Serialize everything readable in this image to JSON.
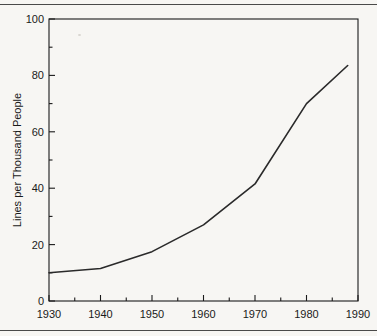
{
  "page": {
    "background_color": "#f7f6f3",
    "rule_color": "#4a4a4a"
  },
  "chart_data": {
    "type": "line",
    "title": "",
    "subtitle": "",
    "xlabel": "",
    "ylabel": "Lines per Thousand People",
    "xlim": [
      1930,
      1990
    ],
    "ylim": [
      0,
      100
    ],
    "grid": false,
    "legend": false,
    "legend_position": "none",
    "line_color": "#2a2a2a",
    "axis_color": "#1a1a1a",
    "x_ticks": [
      1930,
      1940,
      1950,
      1960,
      1970,
      1980,
      1990
    ],
    "x_tick_labels": [
      "1930",
      "1940",
      "1950",
      "1960",
      "1970",
      "1980",
      "1990"
    ],
    "x_minor_ticks": [
      1935,
      1945,
      1955,
      1965,
      1975,
      1985
    ],
    "y_ticks": [
      0,
      20,
      40,
      60,
      80,
      100
    ],
    "y_tick_labels": [
      "0",
      "20",
      "40",
      "60",
      "80",
      "100"
    ],
    "y_minor_ticks": [
      10,
      30,
      50,
      70,
      90
    ],
    "x": [
      1930,
      1940,
      1950,
      1960,
      1970,
      1980,
      1988
    ],
    "values": [
      10,
      11.5,
      17.5,
      27,
      41.5,
      70,
      83.5
    ],
    "series": [
      {
        "name": "Lines per Thousand People",
        "x": [
          1930,
          1940,
          1950,
          1960,
          1970,
          1980,
          1988
        ],
        "values": [
          10,
          11.5,
          17.5,
          27,
          41.5,
          70,
          83.5
        ]
      }
    ],
    "annotations": []
  }
}
